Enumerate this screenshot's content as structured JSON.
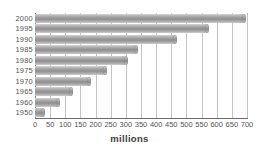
{
  "chart_data": {
    "type": "bar",
    "orientation": "horizontal",
    "title": "",
    "xlabel": "millions",
    "ylabel": "",
    "categories": [
      "2000",
      "1995",
      "1990",
      "1985",
      "1980",
      "1975",
      "1970",
      "1965",
      "1960",
      "1950"
    ],
    "values": [
      695,
      570,
      465,
      337,
      303,
      235,
      180,
      123,
      80,
      30
    ],
    "xlim": [
      0,
      700
    ],
    "xticks": [
      0,
      50,
      100,
      150,
      200,
      250,
      300,
      350,
      400,
      450,
      500,
      550,
      600,
      650,
      700
    ],
    "xticklabels": [
      "0",
      "50",
      "100",
      "150",
      "200",
      "250",
      "300",
      "350",
      "400",
      "450",
      "500",
      "550",
      "600",
      "650",
      "700"
    ],
    "grid": "vertical",
    "legend": "none",
    "bar_style": "cylinder-3d",
    "bar_color": "#9e9e9e",
    "grid_color": "#c4c4c4",
    "axis_color": "#6b6b6b",
    "text_color": "#555555"
  }
}
